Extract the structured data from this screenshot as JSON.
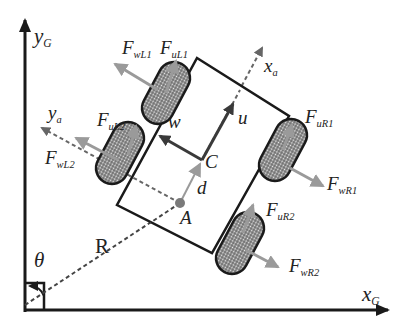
{
  "diagram": {
    "type": "mecanum-wheeled-vehicle-kinematics",
    "axes": {
      "global_x": {
        "main": "x",
        "sub": "G"
      },
      "global_y": {
        "main": "y",
        "sub": "G"
      },
      "body_x": {
        "main": "x",
        "sub": "a"
      },
      "body_y": {
        "main": "y",
        "sub": "a"
      }
    },
    "points": {
      "center": "C",
      "reference": "A"
    },
    "velocities": {
      "longitudinal": "u",
      "lateral": "w"
    },
    "distances": {
      "offset": "d",
      "radius": "R"
    },
    "angle": "θ",
    "forces": {
      "wL1": {
        "main": "F",
        "sub": "wL1"
      },
      "uL1": {
        "main": "F",
        "sub": "uL1"
      },
      "uL2": {
        "main": "F",
        "sub": "uL2"
      },
      "wL2": {
        "main": "F",
        "sub": "wL2"
      },
      "uR1": {
        "main": "F",
        "sub": "uR1"
      },
      "wR1": {
        "main": "F",
        "sub": "wR1"
      },
      "uR2": {
        "main": "F",
        "sub": "uR2"
      },
      "wR2": {
        "main": "F",
        "sub": "wR2"
      }
    },
    "colors": {
      "line": "#1a1a1a",
      "force_arrow": "#9a9a9a",
      "dashed": "#555555",
      "wheel_fill": "#8a8a8a"
    }
  }
}
